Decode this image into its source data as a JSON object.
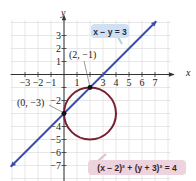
{
  "chart_data": {
    "type": "line",
    "title": "",
    "xlabel": "x",
    "ylabel": "y",
    "xlim": [
      -4,
      8
    ],
    "ylim": [
      -8,
      4
    ],
    "grid": true,
    "x_ticks": [
      -3,
      -2,
      -1,
      1,
      2,
      3,
      4,
      5,
      6,
      7
    ],
    "x_tick_labels": [
      "−3",
      "−2",
      "−1",
      "1",
      "",
      "3",
      "4",
      "5",
      "6",
      "7"
    ],
    "y_ticks": [
      3,
      2,
      1,
      -1,
      -2,
      -3,
      -4,
      -5,
      -6,
      -7
    ],
    "y_tick_labels": [
      "3",
      "2",
      "1",
      "",
      "−2",
      "",
      "−4",
      "−5",
      "−6",
      "−7"
    ],
    "series": [
      {
        "name": "x − y = 3",
        "kind": "line",
        "equation": "y = x - 3",
        "x": [
          -4.1,
          7.1
        ],
        "y": [
          -7.1,
          4.1
        ],
        "color": "#3b4fa8"
      },
      {
        "name": "(x − 2)² + (y + 3)² = 4",
        "kind": "circle",
        "center": [
          2,
          -3
        ],
        "radius": 2,
        "color": "#7a1f33"
      }
    ],
    "points": [
      {
        "label": "(2, −1)",
        "x": 2,
        "y": -1
      },
      {
        "label": "(0, −3)",
        "x": 0,
        "y": -3
      }
    ],
    "annotations": [
      {
        "text": "x − y = 3",
        "style": "callout",
        "color": "#cfe0f3"
      },
      {
        "text": "(x − 2)² + (y + 3)² = 4",
        "style": "callout",
        "color": "#ecd3de"
      }
    ]
  },
  "labels": {
    "x_axis": "x",
    "y_axis": "y",
    "line_eq": "x − y = 3",
    "circle_eq": "(x − 2)² + (y + 3)² = 4",
    "pt1": "(2, −1)",
    "pt2": "(0, −3)"
  }
}
